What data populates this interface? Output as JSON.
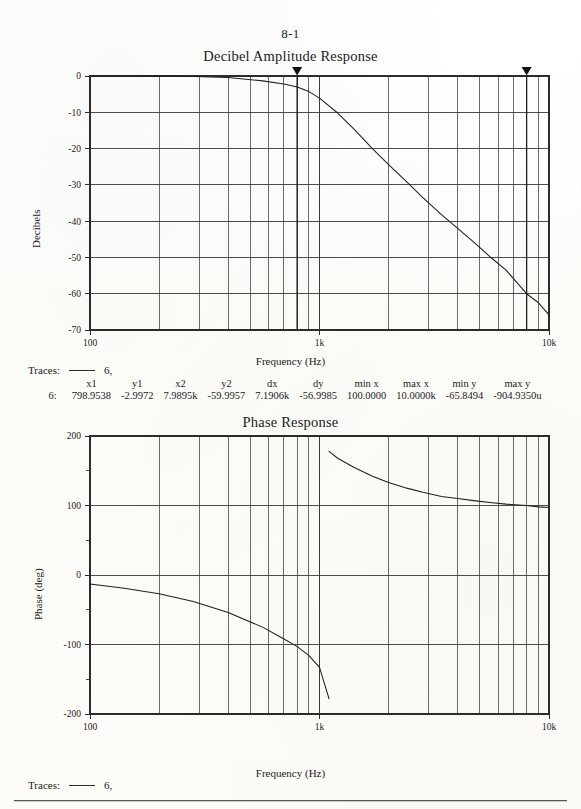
{
  "page": {
    "number": "8-1",
    "frequency_axis_label": "Frequency (Hz)"
  },
  "amplitude_plot": {
    "title": "Decibel Amplitude Response",
    "ylabel": "Decibels",
    "xlabel": "Frequency (Hz)",
    "yticks": [
      "0",
      "-10",
      "-20",
      "-30",
      "-40",
      "-50",
      "-60",
      "-70"
    ],
    "xticks": [
      "100",
      "1k",
      "10k"
    ],
    "traces_label": "Traces:",
    "trace_name": "6,"
  },
  "phase_plot": {
    "title": "Phase Response",
    "ylabel": "Phase (deg)",
    "xlabel": "Frequency (Hz)",
    "yticks": [
      "200",
      "100",
      "0",
      "-100",
      "-200"
    ],
    "xticks": [
      "100",
      "1k",
      "10k"
    ],
    "traces_label": "Traces:",
    "trace_name": "6,"
  },
  "cursor_table": {
    "headers": [
      "",
      "x1",
      "y1",
      "x2",
      "y2",
      "dx",
      "dy",
      "min x",
      "max x",
      "min y",
      "max y"
    ],
    "rows": [
      {
        "label": "6:",
        "x1": "798.9538",
        "y1": "-2.9972",
        "x2": "7.9895k",
        "y2": "-59.9957",
        "dx": "7.1906k",
        "dy": "-56.9985",
        "min_x": "100.0000",
        "max_x": "10.0000k",
        "min_y": "-65.8494",
        "max_y": "-904.9350u"
      }
    ]
  },
  "chart_data": [
    {
      "type": "line",
      "title": "Decibel Amplitude Response",
      "xlabel": "Frequency (Hz)",
      "ylabel": "Decibels",
      "xscale": "log",
      "xlim": [
        100,
        10000
      ],
      "ylim": [
        -70,
        0
      ],
      "xticks": [
        100,
        1000,
        10000
      ],
      "xticklabels": [
        "100",
        "1k",
        "10k"
      ],
      "yticks": [
        0,
        -10,
        -20,
        -30,
        -40,
        -50,
        -60,
        -70
      ],
      "grid": true,
      "legend": "6,",
      "cursors": [
        {
          "name": "cursor1",
          "x": 798.9538,
          "y": -2.9972
        },
        {
          "name": "cursor2",
          "x": 7989.5,
          "y": -59.9957
        }
      ],
      "x": [
        100,
        141,
        200,
        282,
        400,
        565,
        700,
        799,
        900,
        1000,
        1200,
        1410,
        1700,
        2000,
        2400,
        2820,
        3400,
        4000,
        4700,
        5650,
        6500,
        7989,
        9000,
        10000
      ],
      "y": [
        -0.0009,
        -0.005,
        -0.03,
        -0.11,
        -0.43,
        -1.34,
        -2.2,
        -3.0,
        -4.3,
        -6.1,
        -10.2,
        -14.6,
        -20.0,
        -24.4,
        -29.2,
        -33.5,
        -38.2,
        -42.0,
        -45.8,
        -50.3,
        -53.5,
        -60.0,
        -62.5,
        -65.85
      ]
    },
    {
      "type": "line",
      "title": "Phase Response",
      "xlabel": "Frequency (Hz)",
      "ylabel": "Phase (deg)",
      "xscale": "log",
      "xlim": [
        100,
        10000
      ],
      "ylim": [
        -200,
        200
      ],
      "xticks": [
        100,
        1000,
        10000
      ],
      "xticklabels": [
        "100",
        "1k",
        "10k"
      ],
      "yticks": [
        200,
        100,
        0,
        -100,
        -200
      ],
      "minor_yticks": [
        150,
        50,
        -50,
        -150
      ],
      "grid": true,
      "legend": "6,",
      "wrap_at_hz": 1100,
      "x": [
        100,
        141,
        200,
        282,
        400,
        565,
        700,
        800,
        900,
        1000,
        1100,
        1100,
        1200,
        1410,
        1700,
        2000,
        2400,
        2820,
        3400,
        4000,
        4700,
        5650,
        6500,
        7989,
        9000,
        10000
      ],
      "y": [
        -13,
        -19,
        -27,
        -38,
        -54,
        -75,
        -92,
        -103,
        -116,
        -133,
        -178,
        178,
        168,
        155,
        142,
        133,
        125,
        119,
        113,
        110,
        107,
        104,
        102,
        100,
        98,
        97
      ]
    }
  ]
}
